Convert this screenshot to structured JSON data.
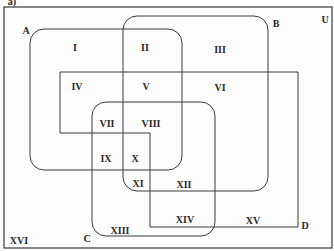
{
  "figure_label": "a)",
  "universe": {
    "label": "U"
  },
  "sets": [
    {
      "id": "A",
      "label": "A",
      "shape": "rounded-rect"
    },
    {
      "id": "B",
      "label": "B",
      "shape": "rounded-rect"
    },
    {
      "id": "C",
      "label": "C",
      "shape": "rounded-rect"
    },
    {
      "id": "D",
      "label": "D",
      "shape": "polygon"
    }
  ],
  "regions": [
    "I",
    "II",
    "III",
    "IV",
    "V",
    "VI",
    "VII",
    "VIII",
    "IX",
    "X",
    "XI",
    "XII",
    "XIII",
    "XIV",
    "XV",
    "XVI"
  ],
  "colors": {
    "line": "#3a3a3a",
    "text": "#2a2a2a",
    "background": "#fdfdfd"
  }
}
